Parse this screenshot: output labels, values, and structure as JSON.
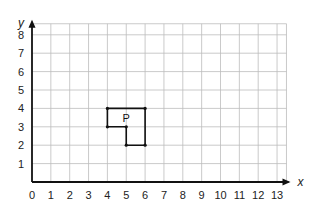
{
  "chart_data": {
    "type": "scatter",
    "title": "",
    "xlabel": "x",
    "ylabel": "y",
    "xlim": [
      0,
      13.5
    ],
    "ylim": [
      0,
      8.6
    ],
    "x_ticks": [
      0,
      1,
      2,
      3,
      4,
      5,
      6,
      7,
      8,
      9,
      10,
      11,
      12,
      13
    ],
    "y_ticks": [
      1,
      2,
      3,
      4,
      5,
      6,
      7,
      8
    ],
    "grid": true,
    "shapes": [
      {
        "name": "P",
        "vertices": [
          [
            4,
            4
          ],
          [
            6,
            4
          ],
          [
            6,
            2
          ],
          [
            5,
            2
          ],
          [
            5,
            3
          ],
          [
            4,
            3
          ]
        ],
        "label_position": [
          5,
          3.5
        ]
      }
    ]
  }
}
